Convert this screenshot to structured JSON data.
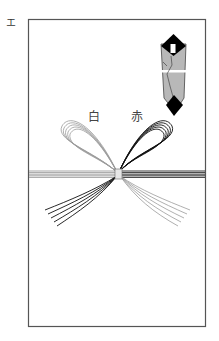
{
  "figure": {
    "corner_label": "エ",
    "left_label": "白",
    "right_label": "赤",
    "colors": {
      "frame": "#555555",
      "white_cord": "#9a9a9a",
      "red_cord": "#111111",
      "noshi_body": "#b8b8b8",
      "noshi_dark": "#000000"
    }
  }
}
